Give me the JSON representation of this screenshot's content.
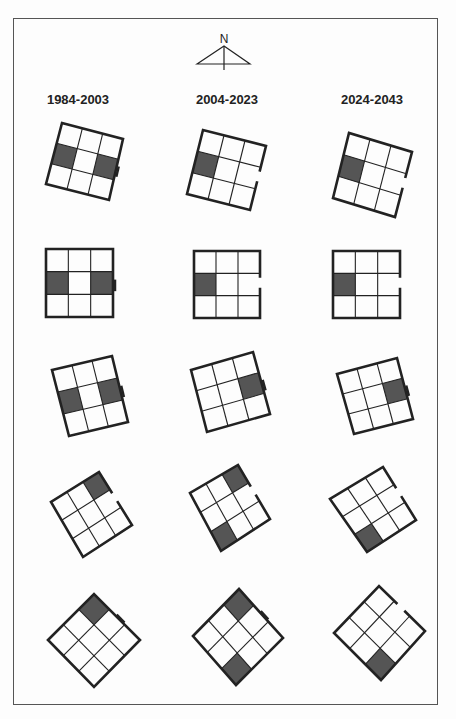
{
  "compass": {
    "label": "N"
  },
  "periods": [
    "1984-2003",
    "2004-2023",
    "2024-2043"
  ],
  "colors": {
    "line": "#222222",
    "shade": "#555555",
    "frame": "#555555",
    "background": "#fdfdfd"
  },
  "figures": [
    {
      "row": 0,
      "col": 0,
      "corners": [
        [
          62,
          123
        ],
        [
          123,
          139
        ],
        [
          109,
          200
        ],
        [
          46,
          184
        ]
      ],
      "shaded": [
        [
          1,
          0
        ],
        [
          1,
          2
        ]
      ],
      "opening": "right-notch"
    },
    {
      "row": 0,
      "col": 1,
      "corners": [
        [
          203,
          130
        ],
        [
          266,
          146
        ],
        [
          250,
          210
        ],
        [
          187,
          194
        ]
      ],
      "shaded": [
        [
          1,
          0
        ]
      ],
      "opening": "right-gap"
    },
    {
      "row": 0,
      "col": 2,
      "corners": [
        [
          349,
          133
        ],
        [
          412,
          152
        ],
        [
          395,
          217
        ],
        [
          333,
          198
        ]
      ],
      "shaded": [
        [
          1,
          0
        ]
      ],
      "opening": "right-gap"
    },
    {
      "row": 1,
      "col": 0,
      "corners": [
        [
          46,
          249
        ],
        [
          113,
          249
        ],
        [
          113,
          317
        ],
        [
          46,
          317
        ]
      ],
      "shaded": [
        [
          1,
          0
        ],
        [
          1,
          2
        ]
      ],
      "opening": "right-notch"
    },
    {
      "row": 1,
      "col": 1,
      "corners": [
        [
          194,
          251
        ],
        [
          260,
          251
        ],
        [
          260,
          318
        ],
        [
          194,
          318
        ]
      ],
      "shaded": [
        [
          1,
          0
        ]
      ],
      "opening": "right-gap"
    },
    {
      "row": 1,
      "col": 2,
      "corners": [
        [
          333,
          251
        ],
        [
          400,
          251
        ],
        [
          400,
          318
        ],
        [
          333,
          318
        ]
      ],
      "shaded": [
        [
          1,
          0
        ]
      ],
      "opening": "right-gap"
    },
    {
      "row": 2,
      "col": 0,
      "corners": [
        [
          52,
          370
        ],
        [
          112,
          356
        ],
        [
          128,
          422
        ],
        [
          69,
          436
        ]
      ],
      "shaded": [
        [
          1,
          0
        ],
        [
          1,
          2
        ]
      ],
      "opening": "right-notch"
    },
    {
      "row": 2,
      "col": 1,
      "corners": [
        [
          191,
          370
        ],
        [
          253,
          352
        ],
        [
          270,
          414
        ],
        [
          207,
          432
        ]
      ],
      "shaded": [
        [
          1,
          2
        ]
      ],
      "opening": "right-notch"
    },
    {
      "row": 2,
      "col": 2,
      "corners": [
        [
          337,
          374
        ],
        [
          397,
          358
        ],
        [
          413,
          419
        ],
        [
          354,
          434
        ]
      ],
      "shaded": [
        [
          1,
          2
        ]
      ],
      "opening": "right-notch"
    },
    {
      "row": 3,
      "col": 0,
      "corners": [
        [
          51,
          502
        ],
        [
          99,
          472
        ],
        [
          132,
          525
        ],
        [
          83,
          557
        ]
      ],
      "shaded": [
        [
          0,
          2
        ]
      ],
      "opening": "right-gap"
    },
    {
      "row": 3,
      "col": 1,
      "corners": [
        [
          190,
          493
        ],
        [
          238,
          465
        ],
        [
          270,
          519
        ],
        [
          221,
          551
        ]
      ],
      "shaded": [
        [
          0,
          2
        ],
        [
          2,
          0
        ]
      ],
      "opening": "right-gap"
    },
    {
      "row": 3,
      "col": 2,
      "corners": [
        [
          330,
          499
        ],
        [
          383,
          467
        ],
        [
          416,
          520
        ],
        [
          367,
          552
        ]
      ],
      "shaded": [
        [
          2,
          0
        ]
      ],
      "opening": "right-gap"
    },
    {
      "row": 4,
      "col": 0,
      "corners": [
        [
          48,
          640
        ],
        [
          94,
          594
        ],
        [
          140,
          640
        ],
        [
          94,
          687
        ]
      ],
      "shaded": [
        [
          0,
          2
        ]
      ],
      "opening": "right-notch"
    },
    {
      "row": 4,
      "col": 1,
      "corners": [
        [
          193,
          636
        ],
        [
          239,
          589
        ],
        [
          283,
          638
        ],
        [
          236,
          685
        ]
      ],
      "shaded": [
        [
          0,
          2
        ],
        [
          2,
          0
        ]
      ],
      "opening": "right-notch"
    },
    {
      "row": 4,
      "col": 2,
      "corners": [
        [
          334,
          633
        ],
        [
          379,
          586
        ],
        [
          425,
          631
        ],
        [
          381,
          680
        ]
      ],
      "shaded": [
        [
          2,
          0
        ]
      ],
      "opening": "right-gap"
    }
  ]
}
